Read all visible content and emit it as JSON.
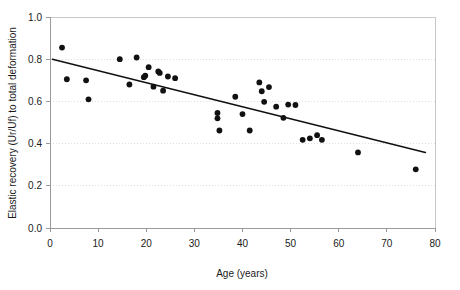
{
  "chart_data": {
    "type": "scatter",
    "title": "",
    "xlabel": "Age (years)",
    "ylabel": "Elastic recovery (Ur/Uf) to total deformation",
    "xlim": [
      0,
      80
    ],
    "ylim": [
      0.0,
      1.0
    ],
    "xticks": [
      0,
      10,
      20,
      30,
      40,
      50,
      60,
      70,
      80
    ],
    "xticklabels": [
      "0",
      "10",
      "20",
      "30",
      "40",
      "50",
      "60",
      "70",
      "80"
    ],
    "yticks": [
      0.0,
      0.2,
      0.4,
      0.6,
      0.8,
      1.0
    ],
    "yticklabels": [
      "0.0",
      "0.2",
      "0.4",
      "0.6",
      "0.8",
      "1.0"
    ],
    "grid": "horizontal-dotted",
    "legend": "none",
    "marker": "filled-circle",
    "marker_color": "#111111",
    "points": [
      {
        "x": 2.5,
        "y": 0.855
      },
      {
        "x": 3.5,
        "y": 0.705
      },
      {
        "x": 7.5,
        "y": 0.7
      },
      {
        "x": 8.0,
        "y": 0.61
      },
      {
        "x": 14.5,
        "y": 0.8
      },
      {
        "x": 16.5,
        "y": 0.68
      },
      {
        "x": 18.0,
        "y": 0.808
      },
      {
        "x": 19.5,
        "y": 0.715
      },
      {
        "x": 19.8,
        "y": 0.722
      },
      {
        "x": 20.5,
        "y": 0.762
      },
      {
        "x": 21.5,
        "y": 0.67
      },
      {
        "x": 22.5,
        "y": 0.742
      },
      {
        "x": 22.8,
        "y": 0.735
      },
      {
        "x": 23.5,
        "y": 0.651
      },
      {
        "x": 24.5,
        "y": 0.718
      },
      {
        "x": 26.0,
        "y": 0.71
      },
      {
        "x": 34.8,
        "y": 0.545
      },
      {
        "x": 34.8,
        "y": 0.52
      },
      {
        "x": 35.2,
        "y": 0.462
      },
      {
        "x": 38.5,
        "y": 0.622
      },
      {
        "x": 40.0,
        "y": 0.54
      },
      {
        "x": 41.5,
        "y": 0.462
      },
      {
        "x": 43.5,
        "y": 0.69
      },
      {
        "x": 44.0,
        "y": 0.648
      },
      {
        "x": 44.5,
        "y": 0.598
      },
      {
        "x": 45.5,
        "y": 0.668
      },
      {
        "x": 47.0,
        "y": 0.575
      },
      {
        "x": 48.5,
        "y": 0.522
      },
      {
        "x": 49.5,
        "y": 0.585
      },
      {
        "x": 51.0,
        "y": 0.583
      },
      {
        "x": 52.5,
        "y": 0.418
      },
      {
        "x": 54.0,
        "y": 0.425
      },
      {
        "x": 55.5,
        "y": 0.44
      },
      {
        "x": 56.5,
        "y": 0.418
      },
      {
        "x": 64.0,
        "y": 0.358
      },
      {
        "x": 76.0,
        "y": 0.278
      }
    ],
    "trend_line": {
      "x_start": 0.5,
      "y_start": 0.8,
      "x_end": 78.0,
      "y_end": 0.358
    }
  }
}
